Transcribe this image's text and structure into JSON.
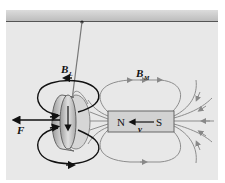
{
  "diagram": {
    "title": "",
    "labels": {
      "induced_field": "B",
      "induced_field_sub": "L",
      "magnet_field": "B",
      "magnet_field_sub": "M",
      "force": "F",
      "velocity": "v",
      "north_pole": "N",
      "south_pole": "S"
    },
    "colors": {
      "background_panel": "#e6e6e6",
      "ceiling_bar": "#c8c8c8",
      "ceiling_line": "#555555",
      "magnet_fill": "#cfcfcf",
      "field_lines": "#8a8a8a",
      "loop_arrows": "#111111",
      "ring_fill": "#b8b8b8"
    }
  }
}
